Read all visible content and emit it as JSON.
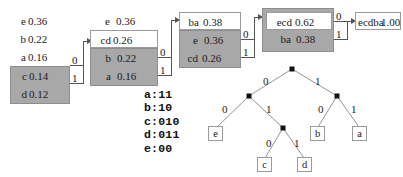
{
  "diagram": {
    "columns": [
      {
        "id": "col1",
        "rows": [
          {
            "symbol": "e",
            "prob": "0.36",
            "style": "plain"
          },
          {
            "symbol": "b",
            "prob": "0.22",
            "style": "plain"
          },
          {
            "symbol": "a",
            "prob": "0.16",
            "style": "plain"
          },
          {
            "symbol": "c",
            "prob": "0.14",
            "style": "shaded"
          },
          {
            "symbol": "d",
            "prob": "0.12",
            "style": "shaded"
          }
        ]
      },
      {
        "id": "col2",
        "rows": [
          {
            "symbol": "e",
            "prob": "0.36",
            "style": "plain"
          },
          {
            "symbol": "cd",
            "prob": "0.26",
            "style": "boxed"
          },
          {
            "symbol": "b",
            "prob": "0.22",
            "style": "shaded"
          },
          {
            "symbol": "a",
            "prob": "0.16",
            "style": "shaded"
          }
        ]
      },
      {
        "id": "col3",
        "rows": [
          {
            "symbol": "ba",
            "prob": "0.38",
            "style": "boxed"
          },
          {
            "symbol": "e",
            "prob": "0.36",
            "style": "shaded"
          },
          {
            "symbol": "cd",
            "prob": "0.26",
            "style": "shaded"
          }
        ]
      },
      {
        "id": "col4",
        "rows": [
          {
            "symbol": "ecd",
            "prob": "0.62",
            "style": "boxed-in-shaded"
          },
          {
            "symbol": "ba",
            "prob": "0.38",
            "style": "shaded"
          }
        ]
      },
      {
        "id": "col5",
        "rows": [
          {
            "symbol": "ecdba",
            "prob": "1.00",
            "style": "boxed"
          }
        ]
      }
    ],
    "merge_bits": [
      {
        "id": "m1-0",
        "label": "0"
      },
      {
        "id": "m1-1",
        "label": "1"
      },
      {
        "id": "m2-0",
        "label": "0"
      },
      {
        "id": "m2-1",
        "label": "1"
      },
      {
        "id": "m3-0",
        "label": "0"
      },
      {
        "id": "m3-1",
        "label": "1"
      },
      {
        "id": "m4-0",
        "label": "0"
      },
      {
        "id": "m4-1",
        "label": "1"
      }
    ]
  },
  "codes": {
    "lines": [
      "a:11",
      "b:10",
      "c:010",
      "d:011",
      "e:00"
    ],
    "text": "a:11\nb:10\nc:010\nd:011\ne:00"
  },
  "tree": {
    "edge_labels": {
      "root_left": "0",
      "root_right": "1",
      "l_left": "0",
      "l_right": "1",
      "r_left": "0",
      "r_right": "1",
      "lr_left": "0",
      "lr_right": "1"
    },
    "leaves": {
      "e": "e",
      "c": "c",
      "d": "d",
      "b": "b",
      "a": "a"
    }
  },
  "colors": {
    "shade": "#a8a8a8",
    "line": "#555555",
    "text": "#1a1a1a",
    "background": "#ffffff"
  }
}
